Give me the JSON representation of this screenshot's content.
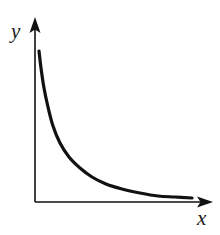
{
  "figure": {
    "background_color": "#ffffff",
    "ink_color": "#111111",
    "width": 220,
    "height": 235
  },
  "axes": {
    "origin": {
      "x": 35,
      "y": 202
    },
    "y_axis": {
      "name": "y-axis",
      "label": "y",
      "from": {
        "x": 35,
        "y": 202
      },
      "to": {
        "x": 35,
        "y": 25
      },
      "arrow_tip": {
        "x": 35,
        "y": 17
      },
      "has_arrow": true,
      "stroke_width": 1.6
    },
    "x_axis": {
      "name": "x-axis",
      "label": "x",
      "from": {
        "x": 35,
        "y": 202
      },
      "to": {
        "x": 203,
        "y": 202
      },
      "arrow_tip": {
        "x": 213,
        "y": 202
      },
      "has_arrow": true,
      "stroke_width": 1.6
    }
  },
  "chart_data": {
    "type": "line",
    "title": "",
    "xlabel": "x",
    "ylabel": "y",
    "grid": false,
    "legend": null,
    "ticks": {
      "x": [],
      "y": []
    },
    "xlim": [
      0,
      1
    ],
    "ylim": [
      0,
      1
    ],
    "series": [
      {
        "name": "decay-curve",
        "description": "monotonically decreasing convex curve approaching the x-axis asymptotically",
        "stroke_width": 3.2,
        "points": [
          {
            "x": 39,
            "y": 51
          },
          {
            "x": 41,
            "y": 68
          },
          {
            "x": 44,
            "y": 88
          },
          {
            "x": 48,
            "y": 107
          },
          {
            "x": 53,
            "y": 126
          },
          {
            "x": 60,
            "y": 143
          },
          {
            "x": 69,
            "y": 157
          },
          {
            "x": 80,
            "y": 168
          },
          {
            "x": 92,
            "y": 177
          },
          {
            "x": 106,
            "y": 184
          },
          {
            "x": 122,
            "y": 189
          },
          {
            "x": 140,
            "y": 193
          },
          {
            "x": 158,
            "y": 196
          },
          {
            "x": 175,
            "y": 197
          },
          {
            "x": 192,
            "y": 198
          }
        ]
      }
    ]
  }
}
